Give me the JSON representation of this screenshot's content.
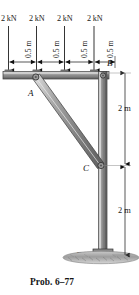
{
  "figure": {
    "caption": "Prob. 6–77",
    "loads": [
      {
        "label": "2 kN",
        "x": 8,
        "magnitude_kN": 2
      },
      {
        "label": "2 kN",
        "x": 36,
        "magnitude_kN": 2
      },
      {
        "label": "2 kN",
        "x": 64,
        "magnitude_kN": 2
      },
      {
        "label": "2 kN",
        "x": 92,
        "magnitude_kN": 2
      }
    ],
    "spacing_labels": [
      {
        "label": "0.5 m",
        "value": 0.5,
        "unit": "m"
      },
      {
        "label": "0.5 m",
        "value": 0.5,
        "unit": "m"
      },
      {
        "label": "0.5 m",
        "value": 0.5,
        "unit": "m"
      },
      {
        "label": "0.5 m",
        "value": 0.5,
        "unit": "m"
      }
    ],
    "vertical_dims": [
      {
        "label": "2 m",
        "value": 2,
        "unit": "m",
        "span": "B to C"
      },
      {
        "label": "2 m",
        "value": 2,
        "unit": "m",
        "span": "C to D"
      }
    ],
    "points": [
      {
        "label": "A",
        "role": "brace-upper-pin"
      },
      {
        "label": "B",
        "role": "beam-column-joint"
      },
      {
        "label": "C",
        "role": "brace-lower-pin"
      },
      {
        "label": "D",
        "role": "fixed-base-support"
      }
    ],
    "colors": {
      "member_light": "#d9d9d9",
      "member_mid": "#8f8f8f",
      "member_dark": "#5a5a5a",
      "outline": "#2b2b2b",
      "ground": "#a8a8a8",
      "text": "#1a1a1a"
    }
  }
}
